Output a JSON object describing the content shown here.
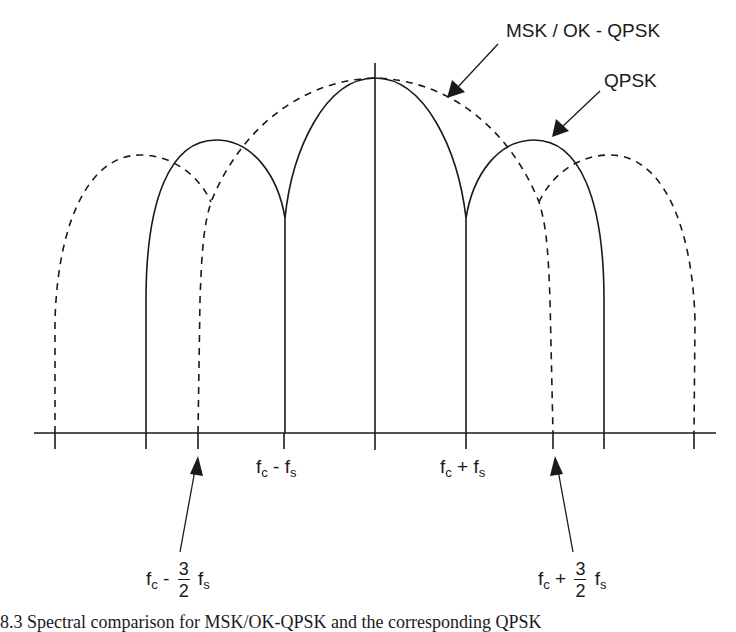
{
  "diagram": {
    "labels": {
      "msk": "MSK / OK - QPSK",
      "qpsk": "QPSK"
    },
    "axis_labels": {
      "fc_minus_fs": {
        "base": "f",
        "sub1": "c",
        "op": "-",
        "base2": "f",
        "sub2": "s"
      },
      "fc_plus_fs": {
        "base": "f",
        "sub1": "c",
        "op": "+",
        "base2": "f",
        "sub2": "s"
      },
      "fc_minus_3half_fs": {
        "base": "f",
        "sub1": "c",
        "op": "-",
        "num": "3",
        "den": "2",
        "base2": "f",
        "sub2": "s"
      },
      "fc_plus_3half_fs": {
        "base": "f",
        "sub1": "c",
        "op": "+",
        "num": "3",
        "den": "2",
        "base2": "f",
        "sub2": "s"
      }
    },
    "caption": "8.3   Spectral comparison for MSK/OK-QPSK and the corresponding QPSK"
  },
  "colors": {
    "ink": "#1a1a1a",
    "background": "#ffffff"
  }
}
